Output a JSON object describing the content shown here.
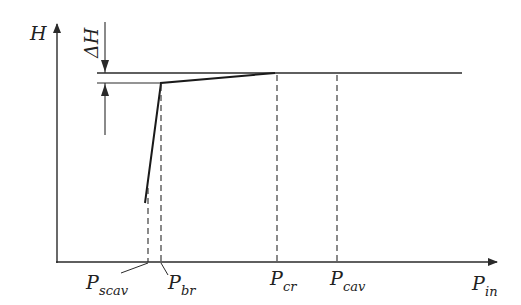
{
  "diagram": {
    "type": "head-vs-inlet-pressure schematic",
    "axes": {
      "y_label": "H",
      "x_label_main": "P",
      "x_label_sub": "in"
    },
    "delta_label": "ΔH",
    "pressure_markers": [
      {
        "id": "scav",
        "main": "P",
        "sub": "scav"
      },
      {
        "id": "br",
        "main": "P",
        "sub": "br"
      },
      {
        "id": "cr",
        "main": "P",
        "sub": "cr"
      },
      {
        "id": "cav",
        "main": "P",
        "sub": "cav"
      }
    ],
    "colors": {
      "line": "#2a2a2a",
      "curve": "#1a1a1a",
      "background": "#ffffff"
    }
  }
}
